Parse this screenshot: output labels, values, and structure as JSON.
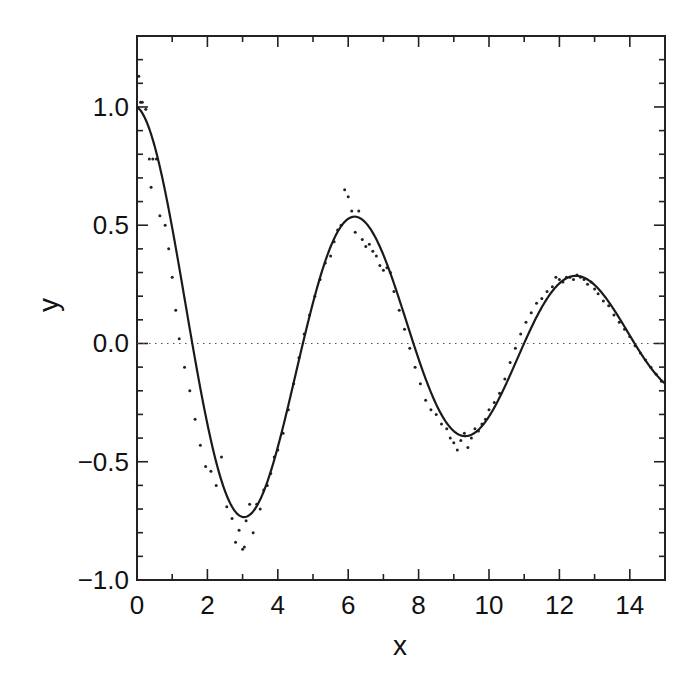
{
  "chart_data": {
    "type": "line",
    "title": "",
    "xlabel": "x",
    "ylabel": "y",
    "xlim": [
      0,
      15
    ],
    "ylim": [
      -1.0,
      1.3
    ],
    "grid": false,
    "legend": null,
    "x_ticks": [
      0,
      2,
      4,
      6,
      8,
      10,
      12,
      14
    ],
    "x_tick_labels": [
      "0",
      "2",
      "4",
      "6",
      "8",
      "10",
      "12",
      "14"
    ],
    "x_minor_ticks": [
      1,
      3,
      5,
      7,
      9,
      11,
      13
    ],
    "y_ticks": [
      -1.0,
      -0.5,
      0.0,
      0.5,
      1.0
    ],
    "y_tick_labels": [
      "−1.0",
      "−0.5",
      "0.0",
      "0.5",
      "1.0"
    ],
    "y_minor_step": 0.1,
    "reference_line": {
      "y": 0.0,
      "style": "dotted"
    },
    "series": [
      {
        "name": "fit",
        "style": "solid-line",
        "function": "cos(x)*exp(-0.1*x)",
        "x": [
          0,
          1,
          2,
          3,
          3.14,
          4,
          5,
          6,
          6.28,
          7,
          8,
          9,
          9.42,
          10,
          11,
          12,
          12.57,
          13,
          14,
          15
        ],
        "values": [
          1.0,
          0.489,
          -0.341,
          -0.733,
          -0.73,
          -0.438,
          0.172,
          0.527,
          0.534,
          0.374,
          -0.065,
          -0.369,
          -0.39,
          -0.309,
          0.001,
          0.254,
          0.285,
          0.248,
          0.03,
          -0.17
        ]
      },
      {
        "name": "data",
        "style": "dots",
        "x": [
          0.05,
          0.1,
          0.15,
          0.25,
          0.35,
          0.4,
          0.45,
          0.55,
          0.65,
          0.8,
          0.9,
          1.0,
          1.1,
          1.2,
          1.35,
          1.5,
          1.65,
          1.8,
          1.95,
          2.1,
          2.25,
          2.4,
          2.55,
          2.7,
          2.8,
          2.9,
          3.0,
          3.05,
          3.1,
          3.2,
          3.3,
          3.4,
          3.5,
          3.6,
          3.7,
          3.8,
          3.9,
          4.0,
          4.15,
          4.3,
          4.45,
          4.6,
          4.75,
          4.9,
          5.05,
          5.2,
          5.35,
          5.5,
          5.6,
          5.7,
          5.8,
          5.9,
          6.0,
          6.1,
          6.2,
          6.3,
          6.4,
          6.5,
          6.6,
          6.7,
          6.8,
          6.9,
          7.0,
          7.1,
          7.2,
          7.3,
          7.45,
          7.6,
          7.75,
          7.9,
          8.05,
          8.2,
          8.35,
          8.5,
          8.65,
          8.8,
          8.9,
          9.0,
          9.1,
          9.2,
          9.3,
          9.4,
          9.5,
          9.6,
          9.7,
          9.8,
          9.9,
          10.0,
          10.15,
          10.3,
          10.45,
          10.6,
          10.75,
          10.9,
          11.05,
          11.2,
          11.35,
          11.5,
          11.65,
          11.8,
          11.9,
          12.0,
          12.1,
          12.2,
          12.3,
          12.4,
          12.5,
          12.6,
          12.7,
          12.8,
          12.9,
          13.0,
          13.1,
          13.25,
          13.4,
          13.55,
          13.7,
          13.85,
          14.0,
          14.15,
          14.3,
          14.45,
          14.6,
          14.75,
          14.9
        ],
        "values": [
          1.13,
          1.02,
          1.02,
          0.99,
          0.78,
          0.66,
          0.78,
          0.78,
          0.54,
          0.5,
          0.4,
          0.28,
          0.14,
          0.02,
          -0.1,
          -0.2,
          -0.32,
          -0.43,
          -0.52,
          -0.54,
          -0.6,
          -0.48,
          -0.69,
          -0.74,
          -0.84,
          -0.79,
          -0.87,
          -0.86,
          -0.75,
          -0.68,
          -0.8,
          -0.68,
          -0.7,
          -0.62,
          -0.6,
          -0.55,
          -0.48,
          -0.45,
          -0.38,
          -0.28,
          -0.17,
          -0.06,
          0.04,
          0.12,
          0.2,
          0.27,
          0.34,
          0.37,
          0.43,
          0.48,
          0.5,
          0.65,
          0.62,
          0.56,
          0.47,
          0.56,
          0.44,
          0.41,
          0.42,
          0.39,
          0.37,
          0.33,
          0.31,
          0.32,
          0.3,
          0.22,
          0.14,
          0.06,
          -0.02,
          -0.1,
          -0.17,
          -0.24,
          -0.28,
          -0.3,
          -0.34,
          -0.36,
          -0.4,
          -0.42,
          -0.45,
          -0.41,
          -0.38,
          -0.44,
          -0.4,
          -0.36,
          -0.37,
          -0.34,
          -0.32,
          -0.28,
          -0.25,
          -0.21,
          -0.15,
          -0.08,
          -0.02,
          0.04,
          0.09,
          0.13,
          0.17,
          0.19,
          0.22,
          0.24,
          0.28,
          0.27,
          0.26,
          0.28,
          0.28,
          0.27,
          0.29,
          0.28,
          0.27,
          0.25,
          0.26,
          0.23,
          0.21,
          0.18,
          0.16,
          0.12,
          0.09,
          0.06,
          0.03,
          -0.01,
          -0.04,
          -0.07,
          -0.1,
          -0.13,
          -0.16
        ]
      }
    ]
  },
  "axes": {
    "x_label": "x",
    "y_label": "y"
  }
}
